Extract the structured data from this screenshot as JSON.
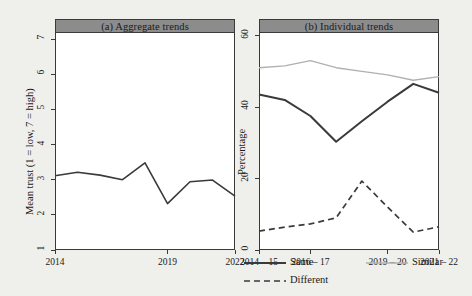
{
  "figure": {
    "background": "#efefec",
    "panel_title_bg": "#8c8c8c",
    "frame_color": "#3a3a3a"
  },
  "chart_data": [
    {
      "type": "line",
      "title": "(a) Aggregate trends",
      "xlabel": "",
      "ylabel": "Mean trust (1 = low, 7 = high)",
      "ylim": [
        1,
        7.2
      ],
      "xlim": [
        2014,
        2022
      ],
      "yticks": [
        1,
        2,
        3,
        4,
        5,
        6,
        7
      ],
      "ytick_labels": [
        "1",
        "2",
        "3",
        "4",
        "5",
        "6",
        "7"
      ],
      "xticks": [
        2014,
        2019,
        2022
      ],
      "xtick_labels": [
        "2014",
        "2019",
        "2022"
      ],
      "grid": false,
      "legend": "none",
      "series": [
        {
          "name": "Mean trust",
          "color": "#3a3a3a",
          "style": "solid",
          "x": [
            2014,
            2015,
            2016,
            2017,
            2018,
            2019,
            2020,
            2021,
            2022
          ],
          "values": [
            3.11,
            3.21,
            3.13,
            3.0,
            3.48,
            2.32,
            2.94,
            2.99,
            2.53
          ]
        }
      ]
    },
    {
      "type": "line",
      "title": "(b) Individual trends",
      "xlabel": "",
      "ylabel": "Percentage",
      "ylim": [
        0,
        61
      ],
      "yticks": [
        0,
        20,
        40,
        60
      ],
      "ytick_labels": [
        "0",
        "20",
        "40",
        "60"
      ],
      "xticks": [
        "2014 – 15",
        "2016 – 17",
        "2019 – 20",
        "2021 – 22"
      ],
      "xtick_labels": [
        "2014 – 15",
        "2016 – 17",
        "2019 – 20",
        "2021 – 22"
      ],
      "x": [
        "2014 – 15",
        "2015 – 16",
        "2016 – 17",
        "2017 – 18",
        "2018 – 19",
        "2019 – 20",
        "2020 – 21",
        "2021 – 22"
      ],
      "grid": false,
      "legend": "bottom",
      "series": [
        {
          "name": "Same",
          "color": "#3a3a3a",
          "style": "solid",
          "width": 2.0,
          "values": [
            43.5,
            42.0,
            37.5,
            30.3,
            36.0,
            41.5,
            46.5,
            44.0
          ]
        },
        {
          "name": "Similar",
          "color": "#b0b0b0",
          "style": "solid",
          "width": 1.3,
          "values": [
            51.0,
            51.5,
            53.0,
            51.0,
            50.0,
            49.0,
            47.5,
            48.5
          ]
        },
        {
          "name": "Different",
          "color": "#3a3a3a",
          "style": "dashed",
          "width": 1.7,
          "values": [
            5.3,
            6.4,
            7.3,
            9.0,
            19.3,
            12.0,
            5.0,
            6.5
          ]
        }
      ]
    }
  ],
  "legend": {
    "items": [
      {
        "label": "Same",
        "color": "#3a3a3a",
        "style": "solid",
        "width": 2.0
      },
      {
        "label": "Similar",
        "color": "#b0b0b0",
        "style": "solid",
        "width": 1.3
      },
      {
        "label": "Different",
        "color": "#3a3a3a",
        "style": "dashed",
        "width": 1.7
      }
    ]
  }
}
